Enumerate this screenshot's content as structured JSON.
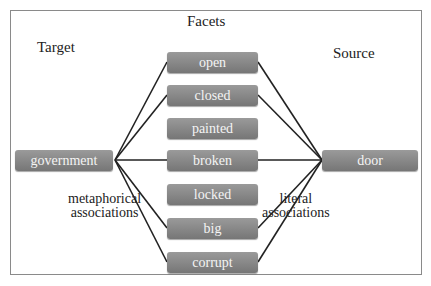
{
  "header": {
    "cut_off_text": "m. Scvcnuc"
  },
  "headings": {
    "target": "Target",
    "facets": "Facets",
    "source": "Source"
  },
  "target_node": {
    "label": "government"
  },
  "source_node": {
    "label": "door"
  },
  "facets": [
    {
      "label": "open",
      "linked_to_target": true,
      "linked_to_source": true
    },
    {
      "label": "closed",
      "linked_to_target": true,
      "linked_to_source": true
    },
    {
      "label": "painted",
      "linked_to_target": false,
      "linked_to_source": false
    },
    {
      "label": "broken",
      "linked_to_target": true,
      "linked_to_source": true
    },
    {
      "label": "locked",
      "linked_to_target": false,
      "linked_to_source": false
    },
    {
      "label": "big",
      "linked_to_target": true,
      "linked_to_source": true
    },
    {
      "label": "corrupt",
      "linked_to_target": true,
      "linked_to_source": true
    }
  ],
  "annotations": {
    "left_line1": "metaphorical",
    "left_line2": "associations",
    "right_line1": "literal",
    "right_line2": "associations"
  },
  "colors": {
    "node_fill": "#8a8a8a",
    "node_text": "#f4f4f4",
    "edge": "#222222",
    "frame": "#8a8a8a"
  }
}
